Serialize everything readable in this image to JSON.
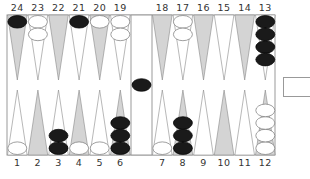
{
  "colors": {
    "dark_point": "#d4d4d4",
    "light_point": "#ffffff",
    "point_stroke": "#888888",
    "frame": "#999999",
    "black_checker": "#1a1a1a",
    "white_checker": "#ffffff"
  },
  "labels": {
    "top": [
      "24",
      "23",
      "22",
      "21",
      "20",
      "19",
      "18",
      "17",
      "16",
      "15",
      "14",
      "13"
    ],
    "bottom": [
      "1",
      "2",
      "3",
      "4",
      "5",
      "6",
      "7",
      "8",
      "9",
      "10",
      "11",
      "12"
    ]
  },
  "points": [
    {
      "point": 1,
      "color": "white",
      "count": 1
    },
    {
      "point": 2,
      "color": "none",
      "count": 0
    },
    {
      "point": 3,
      "color": "black",
      "count": 2
    },
    {
      "point": 4,
      "color": "white",
      "count": 1
    },
    {
      "point": 5,
      "color": "white",
      "count": 1
    },
    {
      "point": 6,
      "color": "black",
      "count": 3
    },
    {
      "point": 7,
      "color": "white",
      "count": 1
    },
    {
      "point": 8,
      "color": "black",
      "count": 3
    },
    {
      "point": 9,
      "color": "none",
      "count": 0
    },
    {
      "point": 10,
      "color": "none",
      "count": 0
    },
    {
      "point": 11,
      "color": "none",
      "count": 0
    },
    {
      "point": 12,
      "color": "white",
      "count": 4
    },
    {
      "point": 13,
      "color": "black",
      "count": 4
    },
    {
      "point": 14,
      "color": "none",
      "count": 0
    },
    {
      "point": 15,
      "color": "none",
      "count": 0
    },
    {
      "point": 16,
      "color": "none",
      "count": 0
    },
    {
      "point": 17,
      "color": "white",
      "count": 2
    },
    {
      "point": 18,
      "color": "none",
      "count": 0
    },
    {
      "point": 19,
      "color": "white",
      "count": 2
    },
    {
      "point": 20,
      "color": "white",
      "count": 1
    },
    {
      "point": 21,
      "color": "black",
      "count": 1
    },
    {
      "point": 22,
      "color": "none",
      "count": 0
    },
    {
      "point": 23,
      "color": "white",
      "count": 2
    },
    {
      "point": 24,
      "color": "black",
      "count": 1
    }
  ],
  "bar": {
    "black": 1,
    "white": 0
  },
  "cube": {
    "value": ""
  }
}
